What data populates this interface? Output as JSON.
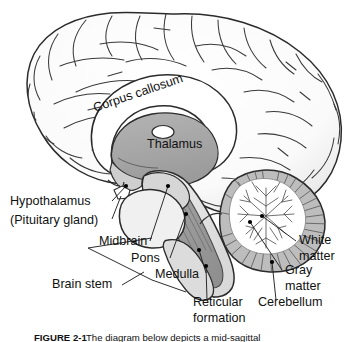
{
  "figure": {
    "caption_prefix": "FIGURE 2-1",
    "caption_text": "The diagram below depicts a mid-sagittal",
    "background_color": "#ffffff",
    "line_color": "#1a1a1a"
  },
  "palette": {
    "outline": "#2b2b2b",
    "cortex_fill": "#fbfbfb",
    "cortex_shadow": "#ececec",
    "thalamus_fill": "#a9a9a9",
    "corpus_callosum_fill": "#ffffff",
    "brainstem_fill": "#e3e3e3",
    "reticular_fill": "#9a9a9a",
    "cerebellum_white": "#ffffff",
    "cerebellum_gray": "#b4b4b4",
    "pons_fill": "#efefef",
    "label_color": "#111111",
    "leader_color": "#333333",
    "dot_color": "#000000"
  },
  "labels": [
    {
      "id": "corpus-callosum",
      "text": "Corpus callosum",
      "x": 95,
      "y": 112,
      "rotation": -19,
      "anchor": "start",
      "leader": false
    },
    {
      "id": "thalamus",
      "text": "Thalamus",
      "x": 147,
      "y": 148,
      "rotation": 0,
      "anchor": "start",
      "leader": false
    },
    {
      "id": "hypothalamus",
      "text": "Hypothalamus",
      "x": 10,
      "y": 205,
      "rotation": 0,
      "anchor": "start",
      "leader": true
    },
    {
      "id": "pituitary-gland",
      "text": "(Pituitary gland)",
      "x": 10,
      "y": 224,
      "rotation": 0,
      "anchor": "start",
      "leader": true
    },
    {
      "id": "midbrain",
      "text": "Midbrain",
      "x": 99,
      "y": 245,
      "rotation": 0,
      "anchor": "start",
      "leader": true
    },
    {
      "id": "pons",
      "text": "Pons",
      "x": 131,
      "y": 262,
      "rotation": 0,
      "anchor": "start",
      "leader": true
    },
    {
      "id": "medulla",
      "text": "Medulla",
      "x": 155,
      "y": 278,
      "rotation": 0,
      "anchor": "start",
      "leader": true
    },
    {
      "id": "brain-stem",
      "text": "Brain stem",
      "x": 52,
      "y": 288,
      "rotation": 0,
      "anchor": "start",
      "leader": true
    },
    {
      "id": "reticular-formation-line1",
      "text": "Reticular",
      "x": 193,
      "y": 306,
      "rotation": 0,
      "anchor": "start",
      "leader": true
    },
    {
      "id": "reticular-formation-line2",
      "text": "formation",
      "x": 193,
      "y": 322,
      "rotation": 0,
      "anchor": "start",
      "leader": false
    },
    {
      "id": "white-matter-line1",
      "text": "White",
      "x": 299,
      "y": 244,
      "rotation": 0,
      "anchor": "start",
      "leader": true
    },
    {
      "id": "white-matter-line2",
      "text": "matter",
      "x": 299,
      "y": 260,
      "rotation": 0,
      "anchor": "start",
      "leader": false
    },
    {
      "id": "gray-matter-line1",
      "text": "Gray",
      "x": 285,
      "y": 274,
      "rotation": 0,
      "anchor": "start",
      "leader": true
    },
    {
      "id": "gray-matter-line2",
      "text": "matter",
      "x": 285,
      "y": 290,
      "rotation": 0,
      "anchor": "start",
      "leader": false
    },
    {
      "id": "cerebellum",
      "text": "Cerebellum",
      "x": 258,
      "y": 306,
      "rotation": 0,
      "anchor": "start",
      "leader": true
    }
  ],
  "structures": [
    {
      "id": "cerebrum",
      "name": "Cerebral cortex"
    },
    {
      "id": "corpus-callosum-body",
      "name": "Corpus callosum"
    },
    {
      "id": "thalamus-body",
      "name": "Thalamus"
    },
    {
      "id": "hypothalamus-body",
      "name": "Hypothalamus"
    },
    {
      "id": "pituitary-body",
      "name": "Pituitary gland"
    },
    {
      "id": "midbrain-body",
      "name": "Midbrain"
    },
    {
      "id": "pons-body",
      "name": "Pons"
    },
    {
      "id": "medulla-body",
      "name": "Medulla"
    },
    {
      "id": "reticular-formation-body",
      "name": "Reticular formation"
    },
    {
      "id": "cerebellum-body",
      "name": "Cerebellum"
    },
    {
      "id": "cerebellum-white-matter",
      "name": "Arbor vitae / white matter"
    },
    {
      "id": "cerebellum-gray-matter",
      "name": "Cerebellar cortex / gray matter"
    }
  ]
}
